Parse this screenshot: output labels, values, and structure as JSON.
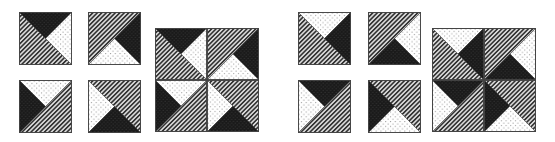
{
  "figure": {
    "colors": {
      "background": "#ffffff",
      "dark": "#1a1a1a",
      "dotted_bg": "#ffffff",
      "dot": "#8a8a8a",
      "stripe_bg": "#d8d8d8",
      "stripe_line": "#333333",
      "border": "#444444"
    },
    "patterns": [
      "striped",
      "dark",
      "dotted"
    ],
    "tiles": [
      {
        "id": "L1",
        "group": "left",
        "role": "small",
        "x": 19,
        "y": 12,
        "size": 53,
        "shapes": [
          {
            "fill": "striped",
            "points": "0,0 0,100 100,100"
          },
          {
            "fill": "dark",
            "points": "0,0 100,0 50,50"
          },
          {
            "fill": "dotted",
            "points": "100,0 50,50 100,100"
          }
        ]
      },
      {
        "id": "L2",
        "group": "left",
        "role": "small",
        "x": 88,
        "y": 12,
        "size": 53,
        "shapes": [
          {
            "fill": "striped",
            "points": "0,0 100,0 0,100"
          },
          {
            "fill": "dark",
            "points": "100,0 50,50 100,100"
          },
          {
            "fill": "dotted",
            "points": "0,100 50,50 100,100"
          }
        ]
      },
      {
        "id": "L3",
        "group": "left",
        "role": "small",
        "x": 19,
        "y": 80,
        "size": 53,
        "shapes": [
          {
            "fill": "striped",
            "points": "100,0 100,100 0,100"
          },
          {
            "fill": "dotted",
            "points": "0,0 100,0 50,50"
          },
          {
            "fill": "dark",
            "points": "0,0 50,50 0,100"
          }
        ]
      },
      {
        "id": "L4",
        "group": "left",
        "role": "small",
        "x": 88,
        "y": 80,
        "size": 53,
        "shapes": [
          {
            "fill": "striped",
            "points": "0,0 100,0 100,100"
          },
          {
            "fill": "dotted",
            "points": "0,0 50,50 0,100"
          },
          {
            "fill": "dark",
            "points": "0,100 50,50 100,100"
          }
        ]
      },
      {
        "id": "LB-TL",
        "group": "left",
        "role": "big-quadrant",
        "x": 155,
        "y": 28,
        "size": 52,
        "ref": "L1",
        "shapes": [
          {
            "fill": "striped",
            "points": "0,0 0,100 100,100"
          },
          {
            "fill": "dark",
            "points": "0,0 100,0 50,50"
          },
          {
            "fill": "dotted",
            "points": "100,0 50,50 100,100"
          }
        ]
      },
      {
        "id": "LB-TR",
        "group": "left",
        "role": "big-quadrant",
        "x": 207,
        "y": 28,
        "size": 52,
        "ref": "L2",
        "shapes": [
          {
            "fill": "striped",
            "points": "0,0 100,0 0,100"
          },
          {
            "fill": "dark",
            "points": "100,0 50,50 100,100"
          },
          {
            "fill": "dotted",
            "points": "0,100 50,50 100,100"
          }
        ]
      },
      {
        "id": "LB-BL",
        "group": "left",
        "role": "big-quadrant",
        "x": 155,
        "y": 80,
        "size": 52,
        "ref": "L3",
        "shapes": [
          {
            "fill": "striped",
            "points": "100,0 100,100 0,100"
          },
          {
            "fill": "dotted",
            "points": "0,0 100,0 50,50"
          },
          {
            "fill": "dark",
            "points": "0,0 50,50 0,100"
          }
        ]
      },
      {
        "id": "LB-BR",
        "group": "left",
        "role": "big-quadrant",
        "x": 207,
        "y": 80,
        "size": 52,
        "ref": "L4",
        "shapes": [
          {
            "fill": "striped",
            "points": "0,0 100,0 100,100"
          },
          {
            "fill": "dotted",
            "points": "0,0 50,50 0,100"
          },
          {
            "fill": "dark",
            "points": "0,100 50,50 100,100"
          }
        ]
      },
      {
        "id": "R1",
        "group": "right",
        "role": "small",
        "x": 298,
        "y": 12,
        "size": 53,
        "shapes": [
          {
            "fill": "striped",
            "points": "0,0 0,100 100,100"
          },
          {
            "fill": "dotted",
            "points": "0,0 100,0 50,50"
          },
          {
            "fill": "dark",
            "points": "100,0 50,50 100,100"
          }
        ]
      },
      {
        "id": "R2",
        "group": "right",
        "role": "small",
        "x": 368,
        "y": 12,
        "size": 53,
        "shapes": [
          {
            "fill": "striped",
            "points": "0,0 100,0 0,100"
          },
          {
            "fill": "dotted",
            "points": "100,0 50,50 100,100"
          },
          {
            "fill": "dark",
            "points": "0,100 50,50 100,100"
          }
        ]
      },
      {
        "id": "R3",
        "group": "right",
        "role": "small",
        "x": 298,
        "y": 80,
        "size": 53,
        "shapes": [
          {
            "fill": "striped",
            "points": "100,0 100,100 0,100"
          },
          {
            "fill": "dark",
            "points": "0,0 100,0 50,50"
          },
          {
            "fill": "dotted",
            "points": "0,0 50,50 0,100"
          }
        ]
      },
      {
        "id": "R4",
        "group": "right",
        "role": "small",
        "x": 368,
        "y": 80,
        "size": 53,
        "shapes": [
          {
            "fill": "striped",
            "points": "0,0 100,0 100,100"
          },
          {
            "fill": "dark",
            "points": "0,0 50,50 0,100"
          },
          {
            "fill": "dotted",
            "points": "0,100 50,50 100,100"
          }
        ]
      },
      {
        "id": "RB-TL",
        "group": "right",
        "role": "big-quadrant",
        "x": 432,
        "y": 28,
        "size": 52,
        "ref": "R1",
        "shapes": [
          {
            "fill": "striped",
            "points": "0,0 0,100 100,100"
          },
          {
            "fill": "dotted",
            "points": "0,0 100,0 50,50"
          },
          {
            "fill": "dark",
            "points": "100,0 50,50 100,100"
          }
        ]
      },
      {
        "id": "RB-TR",
        "group": "right",
        "role": "big-quadrant",
        "x": 484,
        "y": 28,
        "size": 52,
        "ref": "R2",
        "shapes": [
          {
            "fill": "striped",
            "points": "0,0 100,0 0,100"
          },
          {
            "fill": "dotted",
            "points": "100,0 50,50 100,100"
          },
          {
            "fill": "dark",
            "points": "0,100 50,50 100,100"
          }
        ]
      },
      {
        "id": "RB-BL",
        "group": "right",
        "role": "big-quadrant",
        "x": 432,
        "y": 80,
        "size": 52,
        "ref": "R3",
        "shapes": [
          {
            "fill": "striped",
            "points": "100,0 100,100 0,100"
          },
          {
            "fill": "dark",
            "points": "0,0 100,0 50,50"
          },
          {
            "fill": "dotted",
            "points": "0,0 50,50 0,100"
          }
        ]
      },
      {
        "id": "RB-BR",
        "group": "right",
        "role": "big-quadrant",
        "x": 484,
        "y": 80,
        "size": 52,
        "ref": "R4",
        "shapes": [
          {
            "fill": "striped",
            "points": "0,0 100,0 100,100"
          },
          {
            "fill": "dark",
            "points": "0,0 50,50 0,100"
          },
          {
            "fill": "dotted",
            "points": "0,100 50,50 100,100"
          }
        ]
      }
    ],
    "big_squares": [
      {
        "id": "left-big-square",
        "x": 155,
        "y": 28,
        "size": 104
      },
      {
        "id": "right-big-square",
        "x": 432,
        "y": 28,
        "size": 104
      }
    ]
  }
}
